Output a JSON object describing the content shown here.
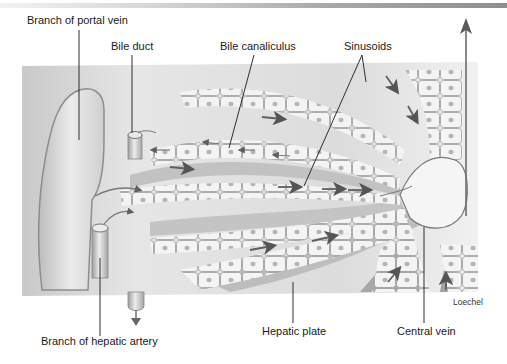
{
  "figure": {
    "labels": {
      "portal_vein": "Branch of portal vein",
      "bile_duct": "Bile duct",
      "bile_canaliculus": "Bile canaliculus",
      "sinusoids": "Sinusoids",
      "hepatic_artery": "Branch of hepatic artery",
      "hepatic_plate": "Hepatic plate",
      "central_vein": "Central vein"
    },
    "credit": "Loechel",
    "colors": {
      "panel_light": "#eeeeee",
      "panel_mid": "#cfcfcf",
      "panel_dark": "#a9a9a9",
      "cell_fill": "#f3f3f3",
      "cell_outline": "#8c8c8c",
      "nucleus": "#b3b3b3",
      "arrow": "#6a6a6a",
      "leader_line": "#1a1a1a",
      "top_rule": "#9a9a9a"
    },
    "icons": [
      "flow-arrow-icon",
      "outflow-arrow-icon",
      "drain-arrow-icon"
    ]
  }
}
